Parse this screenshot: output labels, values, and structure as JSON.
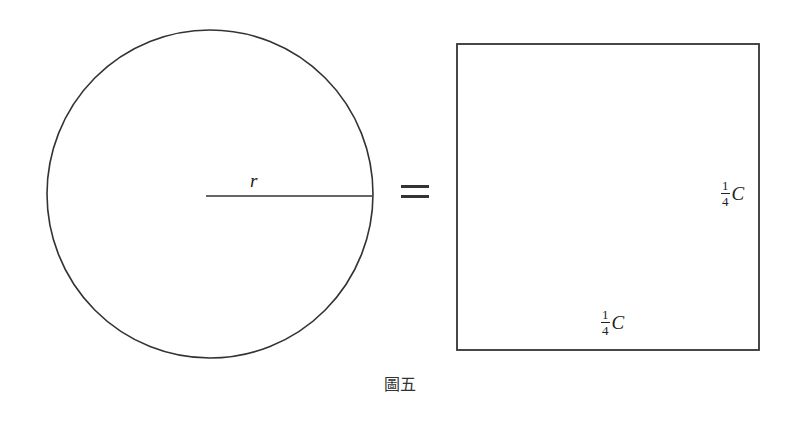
{
  "diagram": {
    "circle": {
      "cx": 210,
      "cy": 194,
      "rx": 163,
      "ry": 164,
      "stroke": "#333333"
    },
    "radius_line": {
      "x1": 206,
      "y1": 196,
      "x2": 372,
      "y2": 196
    },
    "radius_label": "r",
    "equals_sign": "=",
    "square": {
      "x": 457,
      "y": 44,
      "width": 302,
      "height": 306,
      "stroke": "#333333"
    },
    "side_label_right": {
      "numerator": "1",
      "denominator": "4",
      "variable": "C"
    },
    "side_label_bottom": {
      "numerator": "1",
      "denominator": "4",
      "variable": "C"
    },
    "caption": "圖五"
  }
}
